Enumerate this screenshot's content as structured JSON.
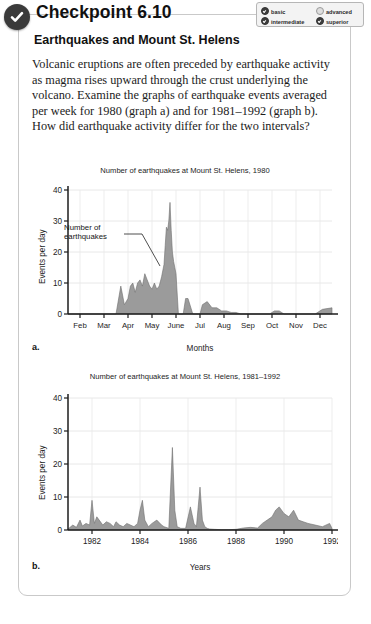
{
  "header": {
    "title": "Checkpoint 6.10",
    "badge_icon": "check-circle-icon",
    "levels": [
      {
        "label": "basic",
        "checked": true
      },
      {
        "label": "intermediate",
        "checked": true
      },
      {
        "label": "advanced",
        "checked": false
      },
      {
        "label": "superior",
        "checked": true
      }
    ]
  },
  "content": {
    "subtitle": "Earthquakes and Mount St. Helens",
    "paragraph": "Volcanic eruptions are often preceded by earthquake activity as magma rises upward through the crust underlying the volcano. Examine the graphs of earthquake events averaged per week for 1980 (graph a) and for 1981–1992 (graph b). How did earthquake activity differ for the two intervals?"
  },
  "chart_data": [
    {
      "type": "area",
      "panel_letter": "a.",
      "title": "Number of earthquakes at Mount St. Helens, 1980",
      "xlabel": "Months",
      "ylabel": "Events per day",
      "annotation": "Number of\nearthquakes",
      "annotation_line1": "Number of",
      "annotation_line2": "earthquakes",
      "ylim": [
        0,
        40
      ],
      "yticks": [
        0,
        10,
        20,
        30,
        40
      ],
      "xticks": [
        "Feb",
        "Mar",
        "Apr",
        "May",
        "June",
        "Jul",
        "Aug",
        "Sep",
        "Oct",
        "Nov",
        "Dec"
      ],
      "grid": true,
      "x": [
        0.0,
        0.5,
        1.0,
        1.5,
        2.0,
        2.2,
        2.35,
        2.5,
        2.6,
        2.7,
        2.8,
        2.9,
        3.0,
        3.1,
        3.2,
        3.3,
        3.4,
        3.5,
        3.6,
        3.7,
        3.8,
        3.9,
        4.0,
        4.05,
        4.1,
        4.15,
        4.2,
        4.25,
        4.3,
        4.35,
        4.4,
        4.45,
        4.5,
        4.6,
        4.7,
        4.8,
        4.9,
        5.0,
        5.2,
        5.4,
        5.5,
        5.6,
        5.8,
        6.0,
        6.2,
        6.4,
        6.6,
        6.8,
        7.0,
        7.2,
        7.4,
        7.6,
        7.8,
        8.0,
        8.2,
        8.4,
        8.6,
        8.8,
        9.0,
        9.5,
        10.0,
        10.3,
        10.6,
        11.0
      ],
      "y": [
        0,
        0,
        0,
        0,
        0,
        9,
        3,
        5,
        9,
        10,
        7,
        10,
        11,
        9,
        13,
        11,
        9,
        8,
        10,
        8,
        9,
        12,
        16,
        22,
        28,
        27,
        30,
        36,
        27,
        20,
        17,
        15,
        13,
        0,
        0,
        0,
        5,
        5,
        0,
        0,
        0,
        3,
        4,
        2,
        2,
        1,
        1,
        0.5,
        0.5,
        0,
        0,
        0,
        0,
        0,
        0,
        0,
        1,
        1,
        0,
        0,
        0,
        0,
        1.5,
        2
      ],
      "series_color": "#9b9b9b"
    },
    {
      "type": "area",
      "panel_letter": "b.",
      "title": "Number of earthquakes at Mount St. Helens, 1981–1992",
      "xlabel": "Years",
      "ylabel": "Events per day",
      "ylim": [
        0,
        40
      ],
      "yticks": [
        0,
        10,
        20,
        30,
        40
      ],
      "xticks": [
        "1982",
        "1984",
        "1986",
        "1988",
        "1990",
        "1992"
      ],
      "xtick_values": [
        1982,
        1984,
        1986,
        1988,
        1990,
        1992
      ],
      "xlim": [
        1981,
        1992
      ],
      "grid": true,
      "x": [
        1981.0,
        1981.2,
        1981.35,
        1981.5,
        1981.6,
        1981.75,
        1981.9,
        1982.0,
        1982.1,
        1982.2,
        1982.3,
        1982.45,
        1982.6,
        1982.75,
        1982.9,
        1983.0,
        1983.15,
        1983.3,
        1983.45,
        1983.6,
        1983.75,
        1983.9,
        1984.0,
        1984.1,
        1984.2,
        1984.35,
        1984.5,
        1984.7,
        1984.9,
        1985.0,
        1985.2,
        1985.35,
        1985.45,
        1985.55,
        1985.7,
        1985.9,
        1986.1,
        1986.25,
        1986.35,
        1986.5,
        1986.6,
        1986.7,
        1986.8,
        1986.9,
        1987.1,
        1987.4,
        1987.7,
        1988.0,
        1988.3,
        1988.6,
        1988.9,
        1989.1,
        1989.3,
        1989.5,
        1989.65,
        1989.8,
        1990.0,
        1990.2,
        1990.4,
        1990.6,
        1990.8,
        1991.0,
        1991.3,
        1991.6,
        1991.9,
        1992.0
      ],
      "y": [
        0.3,
        1.5,
        0.8,
        3,
        1.2,
        2,
        1.5,
        9,
        2,
        4,
        3,
        1.5,
        2.5,
        2,
        1,
        2.5,
        1.5,
        1,
        2,
        1.5,
        1,
        2,
        6,
        9,
        3,
        1,
        2,
        3,
        1.5,
        1,
        0.5,
        25,
        6,
        1,
        0.5,
        0.5,
        7,
        2,
        1,
        13,
        3,
        1,
        0.5,
        0.3,
        0.2,
        0.1,
        0.1,
        0.2,
        0.6,
        0.8,
        0.6,
        2,
        3,
        4,
        6,
        7,
        5,
        4,
        6,
        3,
        2.5,
        2,
        1.5,
        1,
        2,
        0.5
      ],
      "series_color": "#9b9b9b"
    }
  ]
}
